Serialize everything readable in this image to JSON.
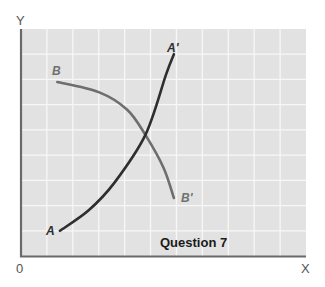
{
  "chart_data": {
    "type": "line",
    "title": "Question 7",
    "xlabel": "X",
    "ylabel": "Y",
    "origin_label": "0",
    "grid": true,
    "legend": "none",
    "axis_ticks": "none (unlabeled grid)",
    "xlim": [
      0,
      11
    ],
    "ylim": [
      0,
      9
    ],
    "series": [
      {
        "name": "AA'",
        "start_label": "A",
        "end_label": "A'",
        "shape": "upward-sloping, convex (steepening)",
        "color": "#2e2e2e",
        "points": [
          [
            1.5,
            1.0
          ],
          [
            2.6,
            1.8
          ],
          [
            3.6,
            2.9
          ],
          [
            4.8,
            4.8
          ],
          [
            5.6,
            7.2
          ],
          [
            5.9,
            8.0
          ]
        ]
      },
      {
        "name": "BB'",
        "start_label": "B",
        "end_label": "B'",
        "shape": "downward-sloping, concave (bowed out)",
        "color": "#6e6e6e",
        "points": [
          [
            1.4,
            6.9
          ],
          [
            3.0,
            6.5
          ],
          [
            4.1,
            5.8
          ],
          [
            4.8,
            4.8
          ],
          [
            5.5,
            3.5
          ],
          [
            5.9,
            2.3
          ]
        ]
      }
    ],
    "intersection": [
      4.8,
      4.8
    ]
  },
  "labels": {
    "y_axis": "Y",
    "x_axis": "X",
    "origin": "0",
    "title": "Question 7",
    "curve_a_start": "A",
    "curve_a_end": "A'",
    "curve_b_start": "B",
    "curve_b_end": "B'"
  },
  "colors": {
    "plot_background": "#e2e2e2",
    "grid_line": "#f7f7f7",
    "axis": "#6a6a6a",
    "curve_a": "#2e2e2e",
    "curve_b": "#6e6e6e",
    "label_a": "#2e2e2e",
    "label_b": "#707070"
  }
}
